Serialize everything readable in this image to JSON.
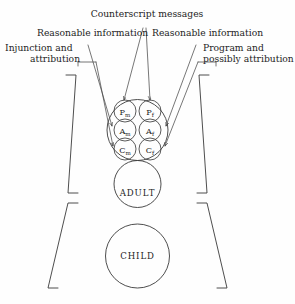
{
  "figure": {
    "background_color": "#fefefe",
    "line_color": "#3a3a3a",
    "text_color": "#1d1d1d"
  },
  "annotations": [
    {
      "id": "counterscript",
      "label": "Counterscript messages"
    },
    {
      "id": "reasonable-left",
      "label": "Reasonable information"
    },
    {
      "id": "reasonable-right",
      "label": "Reasonable information"
    },
    {
      "id": "injunction-line1",
      "label": "Injunction and"
    },
    {
      "id": "injunction-line2",
      "label": "attribution"
    },
    {
      "id": "program-line1",
      "label": "Program and"
    },
    {
      "id": "program-line2",
      "label": "possibly attribution"
    }
  ],
  "ego_states": {
    "parent": {
      "label": "",
      "sub_circles": [
        {
          "id": "parent-in-parent-mother",
          "letter": "P",
          "subscript": "m"
        },
        {
          "id": "parent-in-parent-father",
          "letter": "P",
          "subscript": "f"
        },
        {
          "id": "adult-in-parent-mother",
          "letter": "A",
          "subscript": "m"
        },
        {
          "id": "adult-in-parent-father",
          "letter": "A",
          "subscript": "f"
        },
        {
          "id": "child-in-parent-mother",
          "letter": "C",
          "subscript": "m"
        },
        {
          "id": "child-in-parent-father",
          "letter": "C",
          "subscript": "f"
        }
      ]
    },
    "adult": {
      "label": "ADULT"
    },
    "child": {
      "label": "CHILD"
    }
  }
}
